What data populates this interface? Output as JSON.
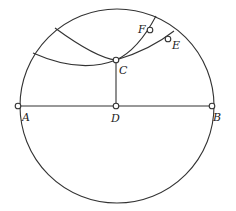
{
  "diagram": {
    "type": "geometric-construction",
    "circle": {
      "cx": 117,
      "cy": 106,
      "r": 97
    },
    "points": {
      "A": {
        "label": "A",
        "x": 18,
        "y": 106,
        "lx": 22,
        "ly": 121
      },
      "B": {
        "label": "B",
        "x": 212,
        "y": 106,
        "lx": 213,
        "ly": 121
      },
      "C": {
        "label": "C",
        "x": 116,
        "y": 60,
        "lx": 119,
        "ly": 74
      },
      "D": {
        "label": "D",
        "x": 116,
        "y": 106,
        "lx": 111,
        "ly": 122
      },
      "E": {
        "label": "E",
        "x": 168,
        "y": 39,
        "lx": 172,
        "ly": 49
      },
      "F": {
        "label": "F",
        "x": 150,
        "y": 30,
        "lx": 138,
        "ly": 33
      }
    },
    "segments": [
      {
        "name": "diameter-AB",
        "from": "A",
        "to": "B"
      },
      {
        "name": "perpendicular-CD",
        "from": "C",
        "to": "D"
      }
    ],
    "arcs": [
      {
        "name": "arc-through-C-F",
        "path": "M 55 28 Q 96 58 116 60 Q 138 50 156 16"
      },
      {
        "name": "arc-through-C-E",
        "path": "M 33 53 Q 80 74 116 60 Q 150 50 174 31"
      }
    ]
  }
}
